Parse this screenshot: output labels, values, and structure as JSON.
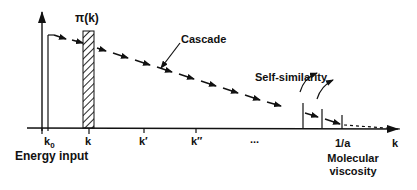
{
  "diagram": {
    "title_label": "π(k)",
    "cascade_label": "Cascade",
    "self_similarity_label": "Self-similarity",
    "axis_label": "k",
    "ticks": {
      "k0": "k",
      "k0_sub": "0",
      "k": "k",
      "k_prime": "k′",
      "k_double_prime": "k″",
      "ellipsis": "...",
      "one_over_a": "1/a"
    },
    "energy_input_label": "Energy input",
    "molecular_label_line1": "Molecular",
    "molecular_label_line2": "viscosity",
    "colors": {
      "ink": "#111111",
      "background": "#ffffff"
    }
  }
}
